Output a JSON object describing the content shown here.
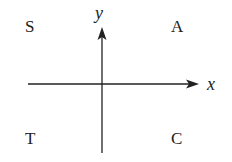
{
  "diagram": {
    "type": "coordinate-quadrants",
    "axes": {
      "x_label": "x",
      "y_label": "y"
    },
    "quadrants": {
      "top_left": "S",
      "top_right": "A",
      "bottom_left": "T",
      "bottom_right": "C"
    },
    "colors": {
      "line": "#222222",
      "text": "#222222",
      "background": "#ffffff"
    }
  }
}
